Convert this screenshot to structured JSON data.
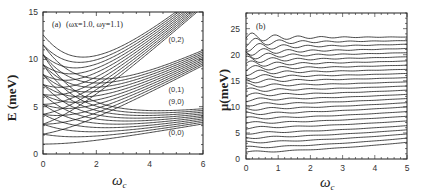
{
  "chart_data": [
    {
      "panel": "a",
      "type": "line",
      "title": "",
      "annotation": "(a) (ω_x=1.0, ω_y=1.1)",
      "panel_label": "(a)",
      "params_label": "(ωx=1.0, ωy=1.1)",
      "xlabel": "ωc",
      "ylabel": "E (meV)",
      "xlim": [
        0,
        6
      ],
      "ylim": [
        0,
        15
      ],
      "xticks": [
        0,
        2,
        4,
        6
      ],
      "yticks": [
        0,
        5,
        10,
        15
      ],
      "grid": false,
      "model": "Fock-Darwin-like levels E = (n+1/2)ω+ + (m+1/2)ω-, ω0≈1.05",
      "omega0": 1.05,
      "bands": [
        {
          "label": "(0,0)",
          "plus_index": 0,
          "minus_indices": [
            0,
            1,
            2,
            3,
            4,
            5,
            6,
            7,
            8,
            9
          ]
        },
        {
          "label": "(0,1)",
          "plus_index": 1,
          "minus_indices": [
            0,
            1,
            2,
            3,
            4,
            5,
            6,
            7,
            8,
            9
          ]
        },
        {
          "label": "(0,2)",
          "plus_index": 2,
          "minus_indices": [
            0,
            1,
            2,
            3,
            4,
            5,
            6,
            7,
            8,
            9
          ]
        }
      ],
      "curve_labels": [
        {
          "text": "(0,2)",
          "x": 5.0,
          "y": 11.8
        },
        {
          "text": "(0,1)",
          "x": 5.0,
          "y": 6.6
        },
        {
          "text": "(9,0)",
          "x": 5.0,
          "y": 5.25
        },
        {
          "text": "(0,0)",
          "x": 5.0,
          "y": 2.0
        }
      ],
      "start_values_at_wc0": [
        1.05,
        2.1,
        3.15,
        4.2,
        5.25,
        6.3,
        7.35,
        8.4,
        9.45,
        10.5,
        11.55,
        12.6
      ]
    },
    {
      "panel": "b",
      "type": "line",
      "title": "",
      "panel_label": "(b)",
      "xlabel": "ωc",
      "ylabel": "μ(meV)",
      "xlim": [
        0,
        5
      ],
      "ylim": [
        0,
        28
      ],
      "xticks": [
        0,
        1,
        2,
        3,
        4,
        5
      ],
      "yticks": [
        0,
        5,
        10,
        15,
        20,
        25
      ],
      "grid": false,
      "series_count": 26,
      "levels_at_wc0": [
        1.3,
        2.2,
        3.2,
        4.1,
        5.0,
        6.0,
        6.9,
        7.8,
        8.7,
        9.6,
        10.5,
        11.4,
        12.3,
        13.2,
        14.1,
        15.0,
        15.8,
        16.6,
        17.4,
        18.2,
        19.0,
        19.8,
        20.6,
        21.5,
        22.4,
        23.3
      ],
      "levels_at_wc5": [
        3.2,
        4.0,
        4.8,
        5.6,
        6.4,
        7.3,
        8.2,
        9.1,
        10.0,
        10.8,
        11.6,
        12.4,
        13.2,
        14.0,
        14.8,
        15.6,
        16.4,
        17.2,
        18.0,
        18.8,
        19.6,
        20.4,
        21.2,
        22.0,
        22.7,
        23.4
      ]
    }
  ],
  "figure": {
    "panel_a": {
      "tick_x": [
        "0",
        "2",
        "4",
        "6"
      ],
      "tick_y": [
        "0",
        "5",
        "10",
        "15"
      ],
      "ylabel": "E (meV)",
      "xlabel": "ωc",
      "subscript": "c",
      "annotation_a": "(a)",
      "annotation_params": "(ωx=1.0, ωy=1.1)"
    },
    "panel_b": {
      "tick_x": [
        "0",
        "1",
        "2",
        "3",
        "4",
        "5"
      ],
      "tick_y": [
        "0",
        "5",
        "10",
        "15",
        "20",
        "25"
      ],
      "ylabel": "μ(meV)",
      "xlabel": "ωc",
      "annotation_b": "(b)"
    },
    "colors": {
      "line": "#1a1a1a",
      "frame": "#222222",
      "background": "#ffffff"
    }
  }
}
